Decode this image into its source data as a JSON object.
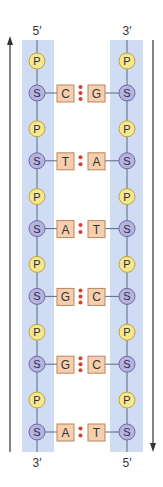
{
  "labels": {
    "left_top": "5′",
    "right_top": "3′",
    "left_bottom": "3′",
    "right_bottom": "5′"
  },
  "node_letters": {
    "phosphate": "P",
    "sugar": "S"
  },
  "base_pairs": [
    {
      "left": "C",
      "right": "G",
      "hbonds": 3
    },
    {
      "left": "T",
      "right": "A",
      "hbonds": 2
    },
    {
      "left": "A",
      "right": "T",
      "hbonds": 2
    },
    {
      "left": "G",
      "right": "C",
      "hbonds": 3
    },
    {
      "left": "G",
      "right": "C",
      "hbonds": 3
    },
    {
      "left": "A",
      "right": "T",
      "hbonds": 2
    }
  ],
  "directions": {
    "left_strand": "up",
    "right_strand": "down"
  },
  "colors": {
    "backbone_band": "#cfdcf3",
    "phosphate_fill": "#f7e68a",
    "phosphate_stroke": "#b9a640",
    "sugar_fill": "#b6b4dc",
    "sugar_stroke": "#6d6aa6",
    "base_fill": "#f7cfae",
    "base_stroke": "#b9865e",
    "hbond_dot": "#d8402c",
    "line": "#5a6a80",
    "arrow": "#333333"
  }
}
